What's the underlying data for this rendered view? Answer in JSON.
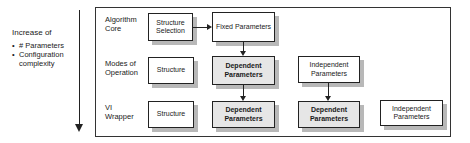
{
  "legend": {
    "title": "Increase of",
    "bullets": [
      "# Parameters",
      "Configuration complexity"
    ]
  },
  "rows": [
    {
      "label": "Algorithm Core",
      "boxes": [
        {
          "text": "Structure Selection",
          "type": "structure"
        },
        {
          "text": "Fixed Parameters",
          "type": "fixed"
        }
      ]
    },
    {
      "label": "Modes of Operation",
      "boxes": [
        {
          "text": "Structure",
          "type": "structure"
        },
        {
          "text": "Dependent Parameters",
          "type": "dependent"
        },
        {
          "text": "Independent Parameters",
          "type": "independent"
        }
      ]
    },
    {
      "label": "VI Wrapper",
      "boxes": [
        {
          "text": "Structure",
          "type": "structure"
        },
        {
          "text": "Dependent Parameters",
          "type": "dependent"
        },
        {
          "text": "Dependent Parameters",
          "type": "dependent"
        },
        {
          "text": "Independent Parameters",
          "type": "independent"
        }
      ]
    }
  ],
  "colors": {
    "dependent_fill": "#e6e6e6",
    "shadow": "#b8b8b8",
    "stroke": "#222222"
  }
}
